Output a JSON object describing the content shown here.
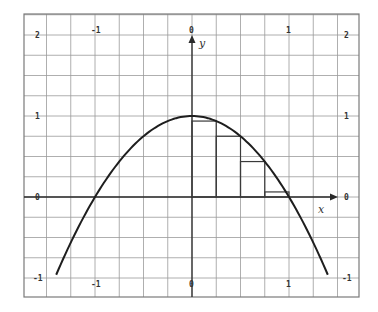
{
  "chart_data": {
    "type": "line",
    "title": "",
    "function": "y = 1 - x^2",
    "xlabel": "x",
    "ylabel": "y",
    "xlim": [
      -1.5,
      1.5
    ],
    "ylim": [
      -1.1,
      2.2
    ],
    "x_tick_labels": [
      "-1",
      "0",
      "1"
    ],
    "x_ticks": [
      -1,
      0,
      1
    ],
    "y_tick_labels": [
      "-1",
      "0",
      "1",
      "2"
    ],
    "y_ticks": [
      -1,
      0,
      1,
      2
    ],
    "grid": true,
    "grid_step_x": 0.25,
    "grid_step_y": 0.25,
    "curve_x_range": [
      -1.4,
      1.4
    ],
    "rectangles": [
      {
        "x0": 0,
        "x1": 0.25,
        "height": 0.9375
      },
      {
        "x0": 0.25,
        "x1": 0.5,
        "height": 0.75
      },
      {
        "x0": 0.5,
        "x1": 0.75,
        "height": 0.4375
      },
      {
        "x0": 0.75,
        "x1": 1.0,
        "height": 0.0625
      }
    ]
  },
  "labels": {
    "x_axis": "x",
    "y_axis": "y",
    "xt_neg1": "-1",
    "xt_0": "0",
    "xt_1": "1",
    "yt_2": "2",
    "yt_1": "1",
    "yt_0": "0",
    "yt_neg1": "-1"
  }
}
